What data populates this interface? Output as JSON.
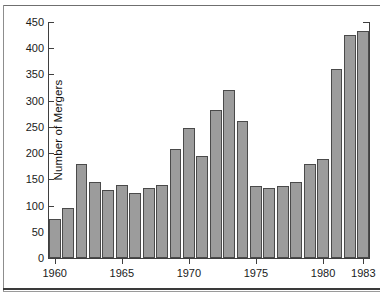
{
  "chart_data": {
    "type": "bar",
    "title": "",
    "xlabel": "",
    "ylabel": "Number of Mergers",
    "ylim": [
      0,
      450
    ],
    "ytick_values": [
      0,
      50,
      100,
      150,
      200,
      250,
      300,
      350,
      400,
      450
    ],
    "ytick_labels": [
      "0",
      "50",
      "100",
      "150",
      "200",
      "250",
      "300",
      "350",
      "400",
      "450"
    ],
    "xtick_labels": [
      "1960",
      "1965",
      "1970",
      "1975",
      "1980",
      "1983"
    ],
    "xtick_categories": [
      "1960",
      "1965",
      "1970",
      "1975",
      "1980",
      "1983"
    ],
    "grid": false,
    "legend": null,
    "bar_color": "#9c9c9c",
    "bar_edge_color": "#4a4a4a",
    "categories": [
      "1960",
      "1961",
      "1962",
      "1963",
      "1964",
      "1965",
      "1966",
      "1967",
      "1968",
      "1969",
      "1970",
      "1971",
      "1972",
      "1973",
      "1974",
      "1975",
      "1976",
      "1977",
      "1978",
      "1979",
      "1980",
      "1981",
      "1982",
      "1983"
    ],
    "values": [
      74,
      95,
      179,
      145,
      129,
      140,
      123,
      134,
      139,
      208,
      248,
      195,
      282,
      321,
      262,
      137,
      133,
      138,
      144,
      179,
      188,
      360,
      425,
      433
    ]
  }
}
